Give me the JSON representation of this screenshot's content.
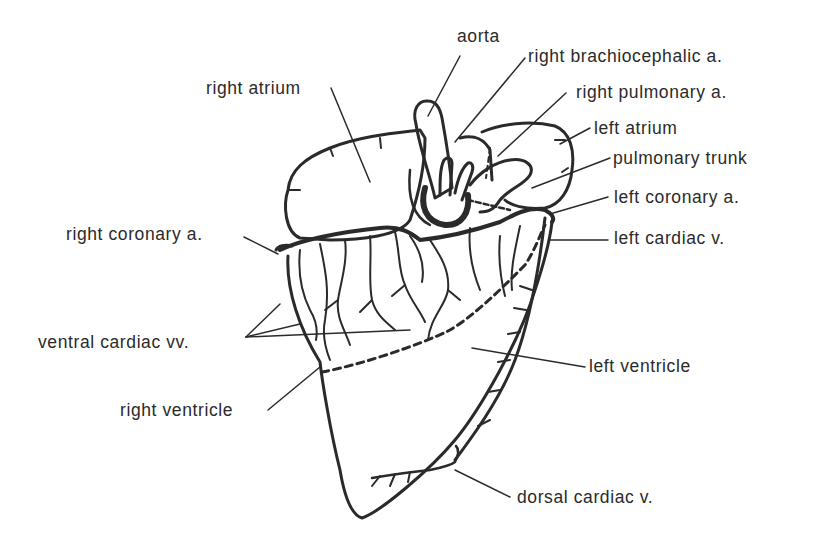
{
  "diagram": {
    "colors": {
      "ink": "#2a2a2a",
      "background": "#ffffff"
    },
    "labels": [
      {
        "id": "aorta",
        "text": "aorta",
        "x": 457,
        "y": 28
      },
      {
        "id": "right-brachiocephalic-a",
        "text": "right brachiocephalic a.",
        "x": 528,
        "y": 48
      },
      {
        "id": "right-pulmonary-a",
        "text": "right pulmonary a.",
        "x": 576,
        "y": 84
      },
      {
        "id": "left-atrium",
        "text": "left atrium",
        "x": 594,
        "y": 120
      },
      {
        "id": "pulmonary-trunk",
        "text": "pulmonary trunk",
        "x": 613,
        "y": 150
      },
      {
        "id": "left-coronary-a",
        "text": "left coronary a.",
        "x": 614,
        "y": 189
      },
      {
        "id": "left-cardiac-v",
        "text": "left cardiac v.",
        "x": 614,
        "y": 230
      },
      {
        "id": "right-atrium",
        "text": "right atrium",
        "x": 206,
        "y": 80
      },
      {
        "id": "right-coronary-a",
        "text": "right coronary a.",
        "x": 66,
        "y": 226
      },
      {
        "id": "ventral-cardiac-vv",
        "text": "ventral cardiac vv.",
        "x": 38,
        "y": 334
      },
      {
        "id": "right-ventricle",
        "text": "right ventricle",
        "x": 120,
        "y": 402
      },
      {
        "id": "left-ventricle",
        "text": "left ventricle",
        "x": 589,
        "y": 358
      },
      {
        "id": "dorsal-cardiac-v",
        "text": "dorsal cardiac v.",
        "x": 517,
        "y": 489
      }
    ]
  }
}
